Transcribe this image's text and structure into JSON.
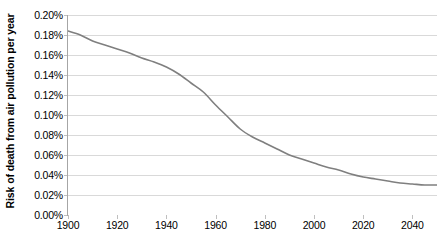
{
  "chart_data": {
    "type": "line",
    "title": "",
    "xlabel": "",
    "ylabel": "Risk of death from air pollution per year",
    "xlim": [
      1900,
      2050
    ],
    "ylim": [
      0.0,
      0.2
    ],
    "grid": "horizontal",
    "legend": "none",
    "y_tick_labels": [
      "0.20%",
      "0.18%",
      "0.16%",
      "0.14%",
      "0.12%",
      "0.10%",
      "0.08%",
      "0.06%",
      "0.04%",
      "0.02%",
      "0.00%"
    ],
    "y_tick_values": [
      0.2,
      0.18,
      0.16,
      0.14,
      0.12,
      0.1,
      0.08,
      0.06,
      0.04,
      0.02,
      0.0
    ],
    "x_tick_labels": [
      "1900",
      "1920",
      "1940",
      "1960",
      "1980",
      "2000",
      "2020",
      "2040"
    ],
    "x_tick_values": [
      1900,
      1920,
      1940,
      1960,
      1980,
      2000,
      2020,
      2040
    ],
    "series": [
      {
        "name": "Risk of death from air pollution per year",
        "color": "#7f7f7f",
        "x": [
          1900,
          1905,
          1910,
          1915,
          1920,
          1925,
          1930,
          1935,
          1940,
          1945,
          1950,
          1955,
          1960,
          1965,
          1970,
          1975,
          1980,
          1985,
          1990,
          1995,
          2000,
          2005,
          2010,
          2015,
          2020,
          2025,
          2030,
          2035,
          2040,
          2045,
          2050
        ],
        "values": [
          0.184,
          0.18,
          0.174,
          0.17,
          0.166,
          0.162,
          0.157,
          0.153,
          0.148,
          0.141,
          0.132,
          0.123,
          0.11,
          0.098,
          0.086,
          0.078,
          0.072,
          0.066,
          0.06,
          0.056,
          0.052,
          0.048,
          0.045,
          0.041,
          0.038,
          0.036,
          0.034,
          0.032,
          0.031,
          0.03,
          0.03
        ]
      }
    ]
  },
  "style": {
    "gridline_color": "#d9d9d9",
    "axis_color": "#a6a6a6",
    "line_color": "#7f7f7f",
    "background": "#ffffff",
    "text_color": "#000000"
  }
}
